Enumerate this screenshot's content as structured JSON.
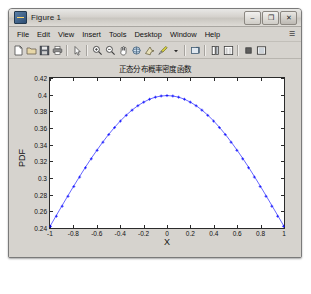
{
  "window": {
    "title": "Figure 1",
    "app_icon": "matlab-figure-icon",
    "controls": {
      "minimize": "–",
      "maximize": "❐",
      "close": "✕"
    }
  },
  "menubar": {
    "items": [
      {
        "label": "File",
        "mnemonic": "F"
      },
      {
        "label": "Edit",
        "mnemonic": "E"
      },
      {
        "label": "View",
        "mnemonic": "V"
      },
      {
        "label": "Insert",
        "mnemonic": "I"
      },
      {
        "label": "Tools",
        "mnemonic": "T"
      },
      {
        "label": "Desktop",
        "mnemonic": "D"
      },
      {
        "label": "Window",
        "mnemonic": "W"
      },
      {
        "label": "Help",
        "mnemonic": "H"
      }
    ],
    "overflow": "☰"
  },
  "toolbar": {
    "buttons": [
      {
        "name": "new-figure-icon",
        "tip": "New Figure"
      },
      {
        "name": "open-file-icon",
        "tip": "Open File"
      },
      {
        "name": "save-figure-icon",
        "tip": "Save Figure"
      },
      {
        "name": "print-figure-icon",
        "tip": "Print Figure"
      },
      {
        "name": "pointer-arrow-icon",
        "tip": "Edit Plot"
      },
      {
        "name": "zoom-in-icon",
        "tip": "Zoom In"
      },
      {
        "name": "zoom-out-icon",
        "tip": "Zoom Out"
      },
      {
        "name": "pan-hand-icon",
        "tip": "Pan"
      },
      {
        "name": "rotate-3d-icon",
        "tip": "Rotate 3D"
      },
      {
        "name": "data-cursor-icon",
        "tip": "Data Cursor"
      },
      {
        "name": "brush-icon",
        "tip": "Brush/Select Data"
      },
      {
        "name": "brush-dropdown-icon",
        "tip": "Brush options"
      },
      {
        "name": "link-plot-icon",
        "tip": "Link Plot"
      },
      {
        "name": "colorbar-icon",
        "tip": "Insert Colorbar"
      },
      {
        "name": "legend-icon",
        "tip": "Insert Legend"
      },
      {
        "name": "hide-plot-tools-icon",
        "tip": "Hide Plot Tools"
      },
      {
        "name": "show-plot-tools-icon",
        "tip": "Show Plot Tools and Dock Figure"
      }
    ]
  },
  "chart_data": {
    "type": "line",
    "title": "正态分布概率密度函数",
    "xlabel": "X",
    "ylabel": "PDF",
    "grid": false,
    "legend": null,
    "marker": "plus",
    "line_color": "#0000ff",
    "marker_color": "#0000ff",
    "xlim": [
      -1,
      1
    ],
    "ylim": [
      0.24,
      0.42
    ],
    "xticks": [
      -1,
      -0.8,
      -0.6,
      -0.4,
      -0.2,
      0,
      0.2,
      0.4,
      0.6,
      0.8,
      1
    ],
    "xticklabels": [
      "-1",
      "-0.8",
      "-0.6",
      "-0.4",
      "-0.2",
      "0",
      "0.2",
      "0.4",
      "0.6",
      "0.8",
      "1"
    ],
    "yticks": [
      0.24,
      0.26,
      0.28,
      0.3,
      0.32,
      0.34,
      0.36,
      0.38,
      0.4,
      0.42
    ],
    "yticklabels": [
      "0.24",
      "0.26",
      "0.28",
      "0.3",
      "0.32",
      "0.34",
      "0.36",
      "0.38",
      "0.4",
      "0.42"
    ],
    "x": [
      -1,
      -0.95,
      -0.9,
      -0.85,
      -0.8,
      -0.75,
      -0.7,
      -0.65,
      -0.6,
      -0.55,
      -0.5,
      -0.45,
      -0.4,
      -0.35,
      -0.3,
      -0.25,
      -0.2,
      -0.15,
      -0.1,
      -0.05,
      0,
      0.05,
      0.1,
      0.15,
      0.2,
      0.25,
      0.3,
      0.35,
      0.4,
      0.45,
      0.5,
      0.55,
      0.6,
      0.65,
      0.7,
      0.75,
      0.8,
      0.85,
      0.9,
      0.95,
      1
    ],
    "y": [
      0.242,
      0.2541,
      0.2661,
      0.278,
      0.2897,
      0.3011,
      0.3123,
      0.323,
      0.3332,
      0.3429,
      0.3521,
      0.3605,
      0.3683,
      0.3752,
      0.3814,
      0.3867,
      0.391,
      0.3945,
      0.397,
      0.3984,
      0.3989,
      0.3984,
      0.397,
      0.3945,
      0.391,
      0.3867,
      0.3814,
      0.3752,
      0.3683,
      0.3605,
      0.3521,
      0.3429,
      0.3332,
      0.323,
      0.3123,
      0.3011,
      0.2897,
      0.278,
      0.2661,
      0.2541,
      0.242
    ]
  }
}
